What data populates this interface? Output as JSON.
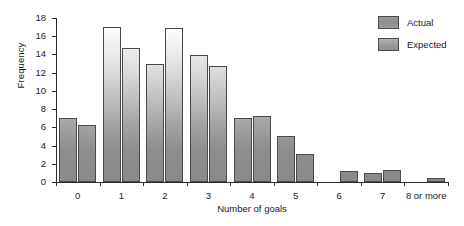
{
  "chart_data": {
    "type": "bar",
    "title": "",
    "xlabel": "Number of goals",
    "ylabel": "Frequency",
    "categories": [
      "0",
      "1",
      "2",
      "3",
      "4",
      "5",
      "6",
      "7",
      "8 or more"
    ],
    "series": [
      {
        "name": "Actual",
        "values": [
          7.0,
          17.0,
          13.0,
          13.9,
          7.0,
          5.0,
          0,
          1.0,
          0
        ]
      },
      {
        "name": "Expected",
        "values": [
          6.3,
          14.7,
          16.9,
          12.7,
          7.2,
          3.1,
          1.2,
          1.3,
          0.4
        ]
      }
    ],
    "ylim": [
      0,
      18
    ],
    "yticks": [
      0,
      2,
      4,
      6,
      8,
      10,
      12,
      14,
      16,
      18
    ],
    "ytick_labels": [
      "0",
      "2",
      "4",
      "6",
      "8",
      "10",
      "12",
      "14",
      "16",
      "18"
    ],
    "grid": false,
    "legend_position": "top-right",
    "legend_entries": [
      "Actual",
      "Expected"
    ],
    "bar_fill": "#8d8d8d",
    "bar_edge": "#4a4a4a",
    "axis_color": "#2b2b2b"
  }
}
